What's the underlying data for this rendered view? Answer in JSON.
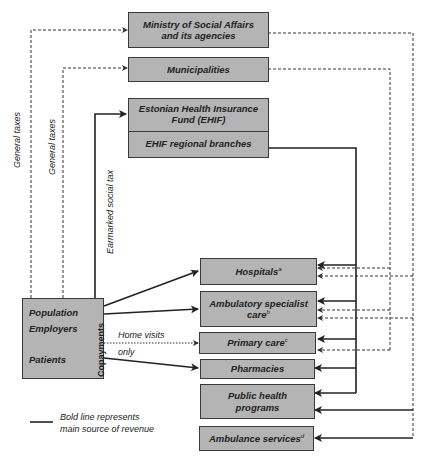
{
  "diagram": {
    "boxes": {
      "ministry": [
        "Ministry of Social Affairs",
        "and its agencies"
      ],
      "municipalities": "Municipalities",
      "ehif": [
        "Estonian Health Insurance",
        "Fund (EHIF)"
      ],
      "ehif_regional": "EHIF regional branches",
      "hospitals": {
        "label": "Hospitals",
        "note": "a"
      },
      "ambulatory": {
        "label1": "Ambulatory specialist",
        "label2": "care",
        "note": "b"
      },
      "primary": {
        "label": "Primary care",
        "note": "c"
      },
      "pharmacies": "Pharmacies",
      "public_health": [
        "Public health",
        "programs"
      ],
      "ambulance": {
        "label": "Ambulance services",
        "note": "d"
      }
    },
    "sources": {
      "population": "Population",
      "employers": "Employers",
      "patients": "Patients",
      "copayments": "Copayments"
    },
    "flow_labels": {
      "general_taxes_1": "General taxes",
      "general_taxes_2": "General taxes",
      "earmarked": "Earmarked social tax",
      "home_visits": "Home visits",
      "only": "only"
    },
    "legend": [
      "Bold line represents",
      "main source of revenue"
    ]
  }
}
